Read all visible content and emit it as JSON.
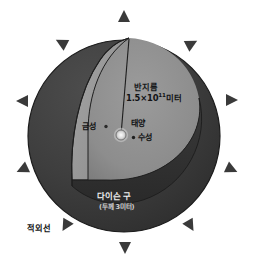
{
  "figure": {
    "title_alt": "다이슨 구 단면도",
    "background_color": "#ffffff",
    "width": 253,
    "height": 272
  },
  "labels": {
    "radius": "반지름",
    "radius_value_mantissa": "1.5×10",
    "radius_value_exponent": "11",
    "radius_value_unit": "미터",
    "venus": "금성",
    "sun": "태양",
    "mercury": "수성",
    "dyson_sphere": "다이슨 구",
    "dyson_sphere_thickness": "(두께 3미터)",
    "infrared": "적외선"
  },
  "colors": {
    "outer_shell": "#3f3f3f",
    "cut_face": "#9a9a9a",
    "inner_cavity": "#8d8d8d",
    "rim_shadow": "#2e2e2e",
    "outline": "#1a1a1a",
    "arrow": "#3a3a3a",
    "sun_glow": "#e8e8e8",
    "label_light": "#f0f0f0",
    "label_dark": "#121314"
  },
  "arrows": {
    "name": "infrared-radiation-arrows",
    "count": 12,
    "items": [
      {
        "id": "arrow-top",
        "x": 124,
        "y": 17,
        "rotation": 0
      },
      {
        "id": "arrow-upper-left",
        "x": 62,
        "y": 43,
        "rotation": -62
      },
      {
        "id": "arrow-upper-right",
        "x": 190,
        "y": 44,
        "rotation": 62
      },
      {
        "id": "arrow-left",
        "x": 23,
        "y": 101,
        "rotation": -90
      },
      {
        "id": "arrow-right",
        "x": 230,
        "y": 100,
        "rotation": 90
      },
      {
        "id": "arrow-lower-left",
        "x": 23,
        "y": 169,
        "rotation": -115
      },
      {
        "id": "arrow-lower-right",
        "x": 230,
        "y": 169,
        "rotation": 115
      },
      {
        "id": "arrow-bottom-left",
        "x": 65,
        "y": 225,
        "rotation": -150
      },
      {
        "id": "arrow-bottom-right",
        "x": 190,
        "y": 225,
        "rotation": 150
      },
      {
        "id": "arrow-bottom",
        "x": 125,
        "y": 247,
        "rotation": 180
      }
    ]
  },
  "geometry": {
    "sphere_center_x": 124,
    "sphere_center_y": 136,
    "sphere_radius": 96,
    "sun_x": 121,
    "sun_y": 135,
    "sun_radius": 6,
    "mercury_x": 133,
    "mercury_y": 137,
    "venus_x": 106,
    "venus_y": 127,
    "radius_line_from": [
      121,
      135
    ],
    "radius_line_to": [
      129,
      38
    ]
  }
}
